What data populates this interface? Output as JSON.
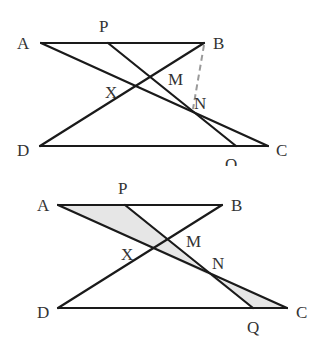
{
  "figures": [
    {
      "id": "top",
      "points": {
        "A": "A",
        "P": "P",
        "B": "B",
        "X": "X",
        "M": "M",
        "N": "N",
        "D": "D",
        "C": "C",
        "Q": "O"
      },
      "segments": [
        "AB",
        "DC",
        "AC",
        "BD",
        "PQ"
      ],
      "dashed_segments": [
        "BN"
      ],
      "shaded_regions": []
    },
    {
      "id": "bottom",
      "points": {
        "A": "A",
        "P": "P",
        "B": "B",
        "X": "X",
        "M": "M",
        "N": "N",
        "D": "D",
        "C": "C",
        "Q": "Q"
      },
      "segments": [
        "AB",
        "DC",
        "AC",
        "BD",
        "PQ"
      ],
      "dashed_segments": [],
      "shaded_regions": [
        "APN",
        "NQC"
      ]
    }
  ],
  "colors": {
    "line": "#1a1a1a",
    "dashed": "#9a9a9a",
    "shade": "#e6e6e6",
    "label": "#333333"
  }
}
